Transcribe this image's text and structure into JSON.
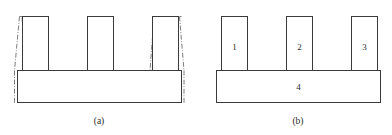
{
  "document": {
    "kind": "technical-line-drawing",
    "panel_count": 2
  },
  "panel_a": {
    "caption": "(a)",
    "description_icon": "ideal-vs-actual-profile-icon",
    "labels": []
  },
  "panel_b": {
    "caption": "(b)",
    "description_icon": "numbered-profile-icon",
    "labels": [
      {
        "text": "1",
        "target": "pillar-left"
      },
      {
        "text": "2",
        "target": "pillar-middle"
      },
      {
        "text": "3",
        "target": "pillar-right"
      },
      {
        "text": "4",
        "target": "base-slab"
      }
    ],
    "pillar_1": "1",
    "pillar_2": "2",
    "pillar_3": "3",
    "base": "4"
  },
  "style": {
    "line_color": "#3a3a3a",
    "chain_line_color": "#6e6e6e",
    "fill_color": "#ffffff",
    "text_color": "#2b2b2b"
  }
}
